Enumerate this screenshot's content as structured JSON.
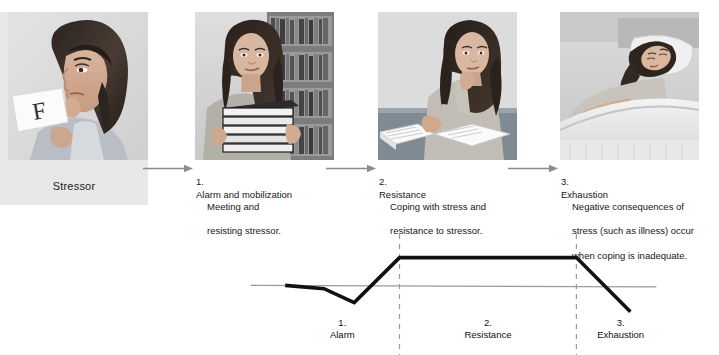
{
  "figure": {
    "background_color": "#ffffff",
    "panel_plate_color": "#e8e8e8",
    "curve_color": "#111111",
    "baseline_color": "#9a9a9a",
    "dashed_divider_color": "#9a9a9a",
    "arrow_color": "#8c8c8c"
  },
  "panels": [
    {
      "id": "stressor",
      "caption": "Stressor",
      "image_name": "woman-looking-at-failing-grade-photo",
      "image_alt": "Young woman with long dark hair holding a paper marked with a large F, hand raised to her mouth in distress"
    },
    {
      "id": "alarm",
      "image_name": "woman-carrying-stack-of-books-photo",
      "image_alt": "Young woman carrying a tall stack of books in front of a library bookshelf"
    },
    {
      "id": "resistance",
      "image_name": "woman-studying-at-desk-photo",
      "image_alt": "Young woman seated at a desk with open books, resting her chin on her hand while studying"
    },
    {
      "id": "exhaustion",
      "image_name": "woman-lying-in-bed-photo",
      "image_alt": "Young woman lying in bed on a pillow with eyes closed, appearing ill and exhausted"
    }
  ],
  "steps": [
    {
      "number": "1.",
      "heading": "Alarm and mobilization",
      "body_line_1": "Meeting and",
      "body_line_2": "resisting stressor."
    },
    {
      "number": "2.",
      "heading": "Resistance",
      "body_line_1": "Coping with stress and",
      "body_line_2": "resistance to stressor."
    },
    {
      "number": "3.",
      "heading": "Exhaustion",
      "body_line_1": "Negative consequences of",
      "body_line_2": "stress (such as illness) occur",
      "body_line_3": "when coping is inadequate."
    }
  ],
  "arrows": [
    {
      "name": "arrow-stressor-to-alarm"
    },
    {
      "name": "arrow-alarm-to-resistance"
    },
    {
      "name": "arrow-resistance-to-exhaustion"
    }
  ],
  "chart_data": {
    "type": "line",
    "title": "",
    "xlabel": "",
    "ylabel": "",
    "grid": false,
    "legend": "none",
    "baseline_label": "normal level of resistance",
    "phase_labels": [
      {
        "number": "1.",
        "name": "Alarm"
      },
      {
        "number": "2.",
        "name": "Resistance"
      },
      {
        "number": "3.",
        "name": "Exhaustion"
      }
    ],
    "phase_boundaries_x": [
      0.365,
      0.775
    ],
    "x": [
      0.1,
      0.19,
      0.26,
      0.365,
      0.775,
      0.9
    ],
    "y": [
      0.0,
      -0.12,
      -0.62,
      1.0,
      1.0,
      -0.95
    ],
    "series": [
      {
        "name": "Resistance to stress",
        "points": [
          {
            "x": 0.1,
            "y": 0.0,
            "note": "baseline resistance before stressor"
          },
          {
            "x": 0.19,
            "y": -0.12,
            "note": "resistance begins to drop"
          },
          {
            "x": 0.26,
            "y": -0.62,
            "note": "alarm: resistance dips below normal"
          },
          {
            "x": 0.365,
            "y": 1.0,
            "note": "resistance rises above normal"
          },
          {
            "x": 0.775,
            "y": 1.0,
            "note": "resistance stage plateau ends"
          },
          {
            "x": 0.9,
            "y": -0.95,
            "note": "exhaustion: resistance collapses"
          }
        ]
      }
    ],
    "ylim": [
      -1.1,
      1.2
    ],
    "xlim": [
      0,
      1
    ]
  }
}
